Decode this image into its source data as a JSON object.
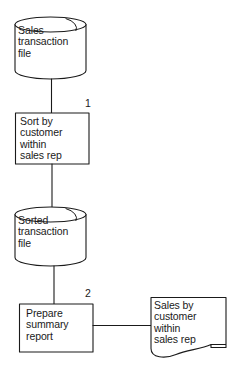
{
  "diagram": {
    "background_color": "#ffffff",
    "stroke_color": "#1a1a1a",
    "text_color": "#1a1a1a",
    "nodes": [
      {
        "id": "sales-transaction-file",
        "shape": "cylinder",
        "role": "data-store",
        "label": "Sales\ntransaction\nfile",
        "number": ""
      },
      {
        "id": "sort-process",
        "shape": "rectangle",
        "role": "process",
        "label": "Sort by\ncustomer\nwithin\nsales rep",
        "number": "1"
      },
      {
        "id": "sorted-transaction-file",
        "shape": "cylinder",
        "role": "data-store",
        "label": "Sorted\ntransaction\nfile",
        "number": ""
      },
      {
        "id": "prepare-process",
        "shape": "rectangle",
        "role": "process",
        "label": "Prepare\nsummary\nreport",
        "number": "2"
      },
      {
        "id": "sales-report-doc",
        "shape": "document",
        "role": "output-document",
        "label": "Sales by\ncustomer\nwithin\nsales rep",
        "number": ""
      }
    ],
    "connectors": [
      {
        "id": "conn-file-to-sort",
        "from": "sales-transaction-file",
        "to": "sort-process",
        "orientation": "vertical"
      },
      {
        "id": "conn-sort-to-sorted",
        "from": "sort-process",
        "to": "sorted-transaction-file",
        "orientation": "vertical"
      },
      {
        "id": "conn-sorted-to-prepare",
        "from": "sorted-transaction-file",
        "to": "prepare-process",
        "orientation": "vertical"
      },
      {
        "id": "conn-prepare-to-doc",
        "from": "prepare-process",
        "to": "sales-report-doc",
        "orientation": "horizontal"
      }
    ]
  }
}
